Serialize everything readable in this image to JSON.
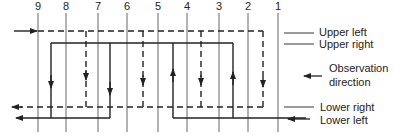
{
  "columns": [
    {
      "label": "9",
      "x": 38
    },
    {
      "label": "8",
      "x": 66
    },
    {
      "label": "7",
      "x": 98
    },
    {
      "label": "6",
      "x": 127
    },
    {
      "label": "5",
      "x": 158
    },
    {
      "label": "4",
      "x": 187
    },
    {
      "label": "3",
      "x": 219
    },
    {
      "label": "2",
      "x": 248
    },
    {
      "label": "1",
      "x": 278
    }
  ],
  "labels": {
    "upper_left": "Upper left",
    "upper_right": "Upper right",
    "observation_line1": "Observation",
    "observation_line2": "direction",
    "lower_right": "Lower right",
    "lower_left": "Lower left"
  },
  "colors": {
    "line": "#222222",
    "column": "#555555"
  }
}
